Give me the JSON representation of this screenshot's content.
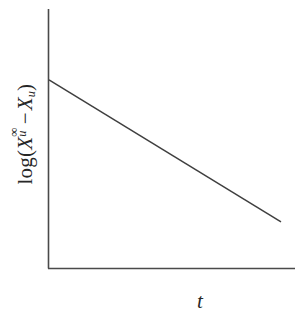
{
  "figure": {
    "background_color": "#ffffff",
    "line_color": "#3f3f3f",
    "axis_color": "#4a4a4a"
  },
  "axes": {
    "y_label": {
      "function": "log",
      "open_paren": "(",
      "term1_var": "X",
      "term1_sub": "u",
      "term1_sup": "∞",
      "operator": "−",
      "term2_var": "X",
      "term2_sub": "u",
      "close_paren": ")",
      "plain_text": "log(X_u^∞ − X_u)"
    },
    "x_label": {
      "text": "t"
    }
  },
  "chart_data": {
    "type": "line",
    "title": "",
    "subtitle": "",
    "xlabel": "t",
    "ylabel": "log(X_u^∞ − X_u)",
    "grid": false,
    "legend": "none",
    "ticks": {
      "x": [],
      "y": []
    },
    "xlim": [
      0,
      1
    ],
    "ylim": [
      0,
      1
    ],
    "axis_style": {
      "spines": [
        "left",
        "bottom"
      ],
      "arrowheads": false,
      "tick_marks": false
    },
    "series": [
      {
        "name": "log(X_u^∞ − X_u) vs t",
        "x": [
          0.0,
          1.0
        ],
        "y": [
          0.735,
          0.18
        ],
        "slope": -0.555,
        "intercept": 0.735,
        "style": "straight-solid-descending"
      }
    ],
    "annotations": []
  }
}
